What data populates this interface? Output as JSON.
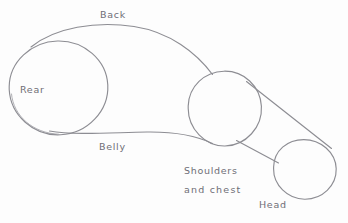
{
  "diagram": {
    "medium": "pencil-sketch",
    "background_color": "#fdfdfd",
    "stroke_color": "#8d8d93",
    "label_color": "#6e6e76",
    "canvas": {
      "width": 348,
      "height": 223
    },
    "labels": {
      "back": "Back",
      "rear": "Rear",
      "belly": "Belly",
      "shoulders": "Shoulders",
      "and_chest": "and  chest",
      "head": "Head"
    },
    "shapes": [
      {
        "name": "rear-circle",
        "type": "circle",
        "label": "Rear",
        "cx": 58.5,
        "cy": 88,
        "r": 49
      },
      {
        "name": "shoulders-circle",
        "type": "circle",
        "label": "Shoulders and chest",
        "cx": 224.5,
        "cy": 109,
        "r": 37
      },
      {
        "name": "head-circle",
        "type": "circle",
        "label": "Head",
        "cx": 304.5,
        "cy": 169.5,
        "r": 31
      },
      {
        "name": "back-curve",
        "type": "curve",
        "label": "Back",
        "from": [
          32,
          46
        ],
        "to": [
          212,
          74
        ]
      },
      {
        "name": "belly-curve",
        "type": "curve",
        "label": "Belly",
        "from": [
          50,
          132
        ],
        "to": [
          212,
          143
        ]
      },
      {
        "name": "neck-upper-line",
        "type": "line",
        "from": [
          247,
          82
        ],
        "to": [
          331,
          148
        ]
      },
      {
        "name": "neck-lower-line",
        "type": "line",
        "from": [
          237,
          141
        ],
        "to": [
          278,
          163
        ]
      }
    ]
  }
}
